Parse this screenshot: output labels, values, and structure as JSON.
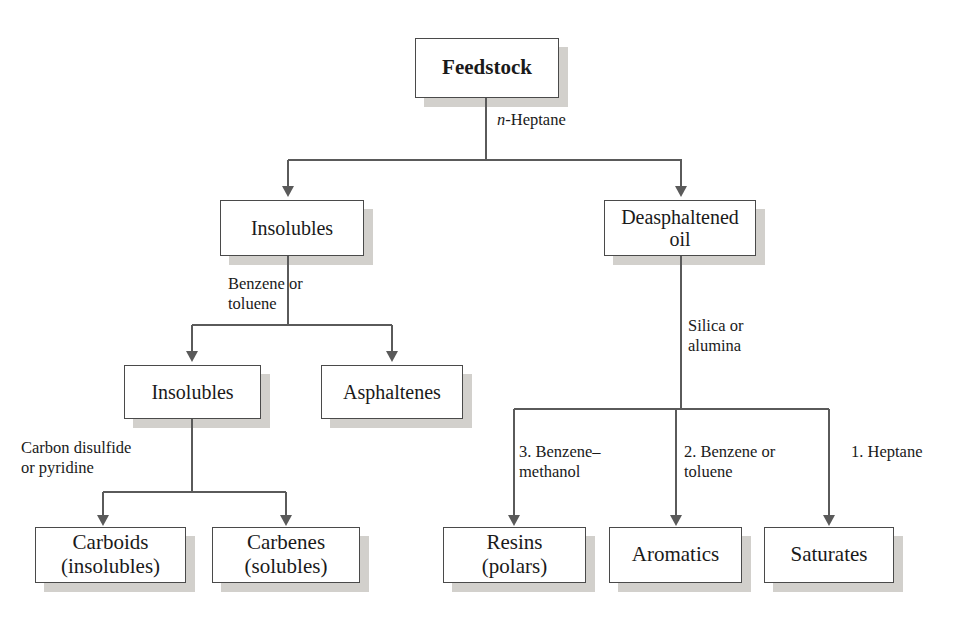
{
  "diagram": {
    "type": "flowchart",
    "colors": {
      "box_border": "#4a4a4a",
      "box_fill": "#ffffff",
      "box_shadow": "#d2d0cc",
      "connector": "#5a5a5a",
      "text": "#1a1a1a"
    },
    "nodes": [
      {
        "id": "feedstock",
        "label": "Feedstock",
        "x": 415,
        "y": 38,
        "w": 144,
        "h": 60,
        "font": 21,
        "bold": true
      },
      {
        "id": "insolubles1",
        "label": "Insolubles",
        "x": 220,
        "y": 200,
        "w": 144,
        "h": 56,
        "font": 20,
        "bold": false
      },
      {
        "id": "deasph_oil",
        "label": "Deasphaltened\noil",
        "x": 604,
        "y": 200,
        "w": 152,
        "h": 56,
        "font": 20,
        "bold": false
      },
      {
        "id": "insolubles2",
        "label": "Insolubles",
        "x": 124,
        "y": 365,
        "w": 137,
        "h": 54,
        "font": 20,
        "bold": false
      },
      {
        "id": "asphaltenes",
        "label": "Asphaltenes",
        "x": 321,
        "y": 365,
        "w": 142,
        "h": 54,
        "font": 20,
        "bold": false
      },
      {
        "id": "carboids",
        "label": "Carboids\n(insolubles)",
        "x": 35,
        "y": 527,
        "w": 151,
        "h": 56,
        "font": 21,
        "bold": false
      },
      {
        "id": "carbenes",
        "label": "Carbenes\n(solubles)",
        "x": 212,
        "y": 527,
        "w": 148,
        "h": 56,
        "font": 21,
        "bold": false
      },
      {
        "id": "resins",
        "label": "Resins\n(polars)",
        "x": 443,
        "y": 527,
        "w": 143,
        "h": 56,
        "font": 21,
        "bold": false
      },
      {
        "id": "aromatics",
        "label": "Aromatics",
        "x": 609,
        "y": 527,
        "w": 133,
        "h": 56,
        "font": 21,
        "bold": false
      },
      {
        "id": "saturates",
        "label": "Saturates",
        "x": 764,
        "y": 527,
        "w": 130,
        "h": 56,
        "font": 21,
        "bold": false
      }
    ],
    "edge_labels": [
      {
        "id": "heptane",
        "text": "n-Heptane",
        "italic_first": true,
        "x": 497,
        "y": 110,
        "align": "left"
      },
      {
        "id": "benzene_tol_1",
        "text": "Benzene or\ntoluene",
        "italic_first": false,
        "x": 228,
        "y": 274,
        "align": "left"
      },
      {
        "id": "silica_alumina",
        "text": "Silica or\nalumina",
        "italic_first": false,
        "x": 688,
        "y": 316,
        "align": "left"
      },
      {
        "id": "carbon_disulf",
        "text": "Carbon disulfide\nor pyridine",
        "italic_first": false,
        "x": 21,
        "y": 438,
        "align": "left"
      },
      {
        "id": "branch_3",
        "text": "3. Benzene–\n    methanol",
        "italic_first": false,
        "x": 519,
        "y": 442,
        "align": "left"
      },
      {
        "id": "branch_2",
        "text": "2. Benzene or\n    toluene",
        "italic_first": false,
        "x": 684,
        "y": 442,
        "align": "left"
      },
      {
        "id": "branch_1",
        "text": "1. Heptane",
        "italic_first": false,
        "x": 851,
        "y": 442,
        "align": "left"
      }
    ],
    "connectors": [
      {
        "id": "feedstock-stem",
        "kind": "v",
        "x": 486,
        "y": 98,
        "len": 62
      },
      {
        "id": "split-1-bar",
        "kind": "h",
        "x": 288,
        "y": 160,
        "len": 394
      },
      {
        "id": "drop-to-insolubles1",
        "kind": "v",
        "x": 288,
        "y": 160,
        "len": 28
      },
      {
        "id": "drop-to-deasph",
        "kind": "v",
        "x": 681,
        "y": 160,
        "len": 28
      },
      {
        "id": "insolubles1-stem",
        "kind": "v",
        "x": 288,
        "y": 256,
        "len": 69
      },
      {
        "id": "split-2-bar",
        "kind": "h",
        "x": 192,
        "y": 325,
        "len": 200
      },
      {
        "id": "drop-to-insolubles2",
        "kind": "v",
        "x": 192,
        "y": 325,
        "len": 28
      },
      {
        "id": "drop-to-asphaltenes",
        "kind": "v",
        "x": 392,
        "y": 325,
        "len": 28
      },
      {
        "id": "insolubles2-stem",
        "kind": "v",
        "x": 192,
        "y": 419,
        "len": 73
      },
      {
        "id": "split-3-bar",
        "kind": "h",
        "x": 103,
        "y": 492,
        "len": 183
      },
      {
        "id": "drop-to-carboids",
        "kind": "v",
        "x": 103,
        "y": 492,
        "len": 25
      },
      {
        "id": "drop-to-carbenes",
        "kind": "v",
        "x": 286,
        "y": 492,
        "len": 25
      },
      {
        "id": "deasph-stem",
        "kind": "v",
        "x": 681,
        "y": 256,
        "len": 153
      },
      {
        "id": "split-4-bar",
        "kind": "h",
        "x": 514,
        "y": 409,
        "len": 315
      },
      {
        "id": "drop-to-resins",
        "kind": "v",
        "x": 514,
        "y": 409,
        "len": 108
      },
      {
        "id": "drop-to-aromatics",
        "kind": "v",
        "x": 676,
        "y": 409,
        "len": 108
      },
      {
        "id": "drop-to-saturates",
        "kind": "v",
        "x": 829,
        "y": 409,
        "len": 108
      }
    ],
    "arrowheads": [
      {
        "id": "arrow-insolubles1",
        "x": 288,
        "y": 186
      },
      {
        "id": "arrow-deasph",
        "x": 681,
        "y": 186
      },
      {
        "id": "arrow-insolubles2",
        "x": 192,
        "y": 351
      },
      {
        "id": "arrow-asphaltenes",
        "x": 392,
        "y": 351
      },
      {
        "id": "arrow-carboids",
        "x": 103,
        "y": 515
      },
      {
        "id": "arrow-carbenes",
        "x": 286,
        "y": 515
      },
      {
        "id": "arrow-resins",
        "x": 514,
        "y": 515
      },
      {
        "id": "arrow-aromatics",
        "x": 676,
        "y": 515
      },
      {
        "id": "arrow-saturates",
        "x": 829,
        "y": 515
      }
    ]
  }
}
